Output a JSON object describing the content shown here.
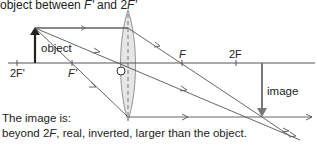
{
  "title": {
    "prefix": "object between ",
    "f_prime": "F'",
    "middle": " and 2",
    "f_prime2": "F'"
  },
  "labels": {
    "object": "object",
    "image": "image",
    "two_f_prime": "2F'",
    "f_prime": "F'",
    "f": "F",
    "two_f": "2F"
  },
  "caption": {
    "line1": "The image is:",
    "line2_prefix": "beyond 2",
    "line2_f": "F",
    "line2_suffix": ", real, inverted, larger than the object."
  },
  "colors": {
    "line": "#555555",
    "object_arrow": "#222222",
    "image_arrow": "#777777",
    "lens_fill": "#e6e6e6",
    "lens_stroke": "#888888",
    "text": "#222222"
  }
}
